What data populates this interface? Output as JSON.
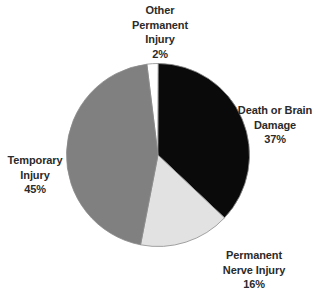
{
  "chart_data": {
    "type": "pie",
    "title": "",
    "subtitle": "",
    "xlabel": "",
    "ylabel": "",
    "legend_position": "none",
    "grid": false,
    "labels_outside": true,
    "start_angle_deg": -7,
    "direction": "clockwise",
    "center": {
      "x": 158,
      "y": 155
    },
    "radius": 91.5,
    "categories": [
      "Other Permanent Injury",
      "Death or Brain Damage",
      "Permanent Nerve Injury",
      "Temporary Injury"
    ],
    "values": [
      2,
      37,
      16,
      45
    ],
    "value_suffix": "%",
    "colors": [
      "#FFFFFF",
      "#0A0A0A",
      "#E2E2E2",
      "#808080"
    ],
    "slice_outline_color": "#8C8C8C",
    "background": "#FFFFFF",
    "text_color": "#2B2B2B",
    "slices": [
      {
        "name": "other-permanent-injury",
        "label_lines": [
          "Other",
          "Permanent",
          "Injury"
        ],
        "value_text": "2%",
        "value": 2,
        "color": "#FFFFFF"
      },
      {
        "name": "death-or-brain-damage",
        "label_lines": [
          "Death or Brain",
          "Damage"
        ],
        "value_text": "37%",
        "value": 37,
        "color": "#0A0A0A"
      },
      {
        "name": "permanent-nerve-injury",
        "label_lines": [
          "Permanent",
          "Nerve Injury"
        ],
        "value_text": "16%",
        "value": 16,
        "color": "#E2E2E2"
      },
      {
        "name": "temporary-injury",
        "label_lines": [
          "Temporary",
          "Injury"
        ],
        "value_text": "45%",
        "value": 45,
        "color": "#808080"
      }
    ]
  }
}
